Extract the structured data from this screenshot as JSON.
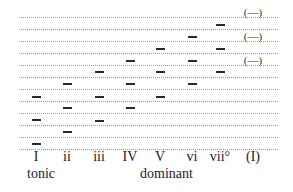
{
  "diagram": {
    "type": "scale-degree chord stacking diagram",
    "staff_lines_y": [
      17,
      29,
      41,
      53,
      65,
      77,
      89,
      101,
      113,
      125,
      137,
      149
    ],
    "columns": [
      {
        "label": "I",
        "x": 36,
        "notes_y": [
          97,
          120,
          144
        ],
        "parenthesized": false
      },
      {
        "label": "ii",
        "x": 67,
        "notes_y": [
          84,
          108,
          132
        ],
        "parenthesized": false
      },
      {
        "label": "iii",
        "x": 99,
        "notes_y": [
          72,
          97,
          121
        ],
        "parenthesized": false
      },
      {
        "label": "IV",
        "x": 130,
        "notes_y": [
          61,
          84,
          108
        ],
        "parenthesized": false
      },
      {
        "label": "V",
        "x": 160,
        "notes_y": [
          49,
          72,
          97
        ],
        "parenthesized": false
      },
      {
        "label": "vi",
        "x": 192,
        "notes_y": [
          37,
          61,
          84
        ],
        "parenthesized": false
      },
      {
        "label": "vii°",
        "x": 220,
        "notes_y": [
          25,
          49,
          72
        ],
        "parenthesized": false
      },
      {
        "label": "(I)",
        "x": 253,
        "notes_y": [
          13,
          37,
          61
        ],
        "parenthesized": true
      }
    ],
    "note_glyph": "—",
    "paren_note_glyph": "(—)",
    "function_labels": [
      {
        "text": "tonic",
        "x": 27
      },
      {
        "text": "dominant",
        "x": 140
      }
    ]
  }
}
